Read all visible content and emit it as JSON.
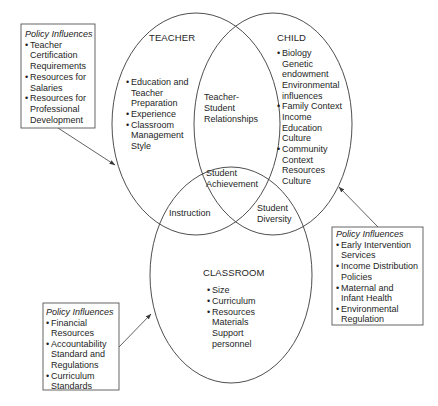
{
  "teacher": {
    "title": "TEACHER",
    "items": [
      {
        "lines": [
          "Education and",
          "Teacher",
          "Preparation"
        ]
      },
      {
        "lines": [
          "Experience"
        ]
      },
      {
        "lines": [
          "Classroom",
          "Management",
          "Style"
        ]
      }
    ]
  },
  "child": {
    "title": "CHILD",
    "items": [
      {
        "lines": [
          "Biology",
          "Genetic",
          "endowment",
          "Environmental",
          "influences"
        ]
      },
      {
        "lines": [
          "Family Context",
          "Income",
          "Education",
          "Culture"
        ]
      },
      {
        "lines": [
          "Community",
          "Context",
          "Resources",
          "Culture"
        ]
      }
    ]
  },
  "classroom": {
    "title": "CLASSROOM",
    "items": [
      {
        "lines": [
          "Size"
        ]
      },
      {
        "lines": [
          "Curriculum"
        ]
      },
      {
        "lines": [
          "Resources",
          "Materials",
          "Support",
          "personnel"
        ]
      }
    ]
  },
  "overlaps": {
    "teacher_child": [
      "Teacher-",
      "Student",
      "Relationships"
    ],
    "center": [
      "Student",
      "Achievement"
    ],
    "teacher_classroom": [
      "Instruction"
    ],
    "child_classroom": [
      "Student",
      "Diversity"
    ]
  },
  "policy_boxes": {
    "teacher": {
      "title": "Policy Influences",
      "items": [
        {
          "lines": [
            "Teacher",
            "Certification",
            "Requirements"
          ]
        },
        {
          "lines": [
            "Resources for",
            "Salaries"
          ]
        },
        {
          "lines": [
            "Resources for",
            "Professional",
            "Development"
          ]
        }
      ]
    },
    "child": {
      "title": "Policy Influences",
      "items": [
        {
          "lines": [
            "Early Intervention",
            "Services"
          ]
        },
        {
          "lines": [
            "Income Distribution",
            "Policies"
          ]
        },
        {
          "lines": [
            "Maternal and",
            "Infant Health"
          ]
        },
        {
          "lines": [
            "Environmental",
            "Regulation"
          ]
        }
      ]
    },
    "classroom": {
      "title": "Policy Influences",
      "items": [
        {
          "lines": [
            "Financial",
            "Resources"
          ]
        },
        {
          "lines": [
            "Accountability",
            "Standard and",
            "Regulations"
          ]
        },
        {
          "lines": [
            "Curriculum",
            "Standards"
          ]
        }
      ]
    }
  },
  "bullet": "•",
  "colors": {
    "stroke": "#3a3a3a",
    "text": "#1e1e1e",
    "background": "#ffffff"
  }
}
